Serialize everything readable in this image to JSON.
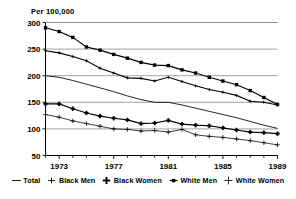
{
  "chart_data": {
    "type": "line",
    "title": "",
    "ylabel": "Per 100,000",
    "xlabel": "",
    "ylim": [
      50,
      300
    ],
    "xlim": [
      1972,
      1989
    ],
    "yticks": [
      50,
      100,
      150,
      200,
      250,
      300
    ],
    "xticks": [
      1973,
      1977,
      1981,
      1985,
      1989
    ],
    "xtick_labels": [
      "1973",
      "1977",
      "1981",
      "1985",
      "1989"
    ],
    "ytick_labels": [
      "50",
      "100",
      "150",
      "200",
      "250",
      "300"
    ],
    "grid": true,
    "grid_axis": "y",
    "legend_position": "bottom",
    "x": [
      1972,
      1973,
      1974,
      1975,
      1976,
      1977,
      1978,
      1979,
      1980,
      1981,
      1982,
      1983,
      1984,
      1985,
      1986,
      1987,
      1988,
      1989
    ],
    "series": [
      {
        "name": "Total",
        "marker": "none",
        "values": [
          200,
          197,
          191,
          184,
          177,
          170,
          162,
          155,
          150,
          150,
          145,
          139,
          133,
          127,
          121,
          114,
          107,
          101
        ]
      },
      {
        "name": "Black Men",
        "marker": "thin-plus",
        "values": [
          247,
          243,
          236,
          228,
          214,
          205,
          196,
          195,
          190,
          197,
          189,
          181,
          174,
          169,
          163,
          152,
          150,
          145
        ]
      },
      {
        "name": "Black Women",
        "marker": "bold-plus",
        "values": [
          147,
          147,
          138,
          130,
          124,
          120,
          117,
          110,
          111,
          116,
          109,
          107,
          106,
          102,
          98,
          94,
          93,
          91
        ]
      },
      {
        "name": "White Men",
        "marker": "filled-square",
        "values": [
          290,
          283,
          272,
          254,
          248,
          240,
          233,
          225,
          220,
          219,
          211,
          205,
          197,
          190,
          183,
          172,
          159,
          146
        ]
      },
      {
        "name": "White Women",
        "marker": "cross-plus",
        "values": [
          127,
          122,
          115,
          110,
          105,
          100,
          99,
          96,
          97,
          94,
          99,
          89,
          86,
          84,
          81,
          78,
          74,
          70
        ]
      }
    ]
  },
  "legend": {
    "items": [
      {
        "label": "Total",
        "marker": "line-marker"
      },
      {
        "label": "Black Men",
        "marker": "thin-plus-marker"
      },
      {
        "label": "Black Women",
        "marker": "bold-plus-marker"
      },
      {
        "label": "White Men",
        "marker": "filled-square-marker"
      },
      {
        "label": "White Women",
        "marker": "cross-plus-marker"
      }
    ]
  },
  "colors": {
    "line": "#000000",
    "grid": "#8a8a8a",
    "axis": "#000000",
    "background": "#ffffff"
  }
}
